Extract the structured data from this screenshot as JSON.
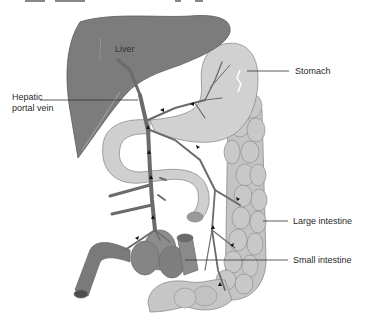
{
  "diagram": {
    "labels": {
      "liver": "Liver",
      "stomach": "Stomach",
      "hepatic_portal_vein": "Hepatic portal vein",
      "large_intestine": "Large intestine",
      "small_intestine": "Small intestine"
    },
    "colors": {
      "liver": "#7a7a7a",
      "liver_shadow": "#5e5e5e",
      "stomach": "#cfcfcf",
      "intestine": "#c4c4c4",
      "intestine_dark": "#a8a8a8",
      "vein": "#6b6b6b",
      "leader_line": "#333333",
      "background": "#ffffff"
    }
  }
}
